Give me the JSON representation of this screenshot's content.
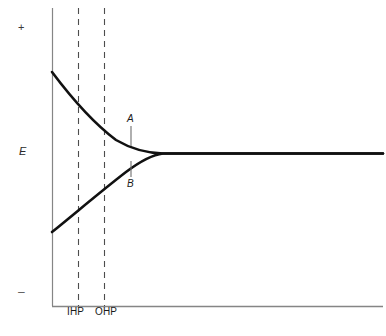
{
  "figure": {
    "type": "scientific-diagram",
    "background_color": "#ffffff",
    "width": 386,
    "height": 336
  },
  "axes": {
    "y_axis": {
      "label": "E",
      "top_sign": "+",
      "bottom_sign": "–",
      "x_px": 52,
      "top_px": 8,
      "bottom_px": 306,
      "color": "#808080"
    },
    "x_axis": {
      "label": "",
      "y_px": 306,
      "left_px": 52,
      "right_px": 383,
      "color": "#808080"
    }
  },
  "markers": [
    {
      "name": "IHP",
      "label": "IHP",
      "x_px": 78,
      "style": "dashed",
      "color": "#4d4d4d"
    },
    {
      "name": "OHP",
      "label": "OHP",
      "x_px": 104,
      "style": "dashed",
      "color": "#4d4d4d"
    }
  ],
  "curve_labels": [
    {
      "id": "A",
      "label": "A",
      "leader_x_px": 131,
      "leader_y1_px": 126,
      "leader_y2_px": 146
    },
    {
      "id": "B",
      "label": "B",
      "leader_x_px": 131,
      "leader_y1_px": 161,
      "leader_y2_px": 177
    }
  ],
  "chart_data": {
    "type": "line",
    "title": "",
    "xlabel": "",
    "ylabel": "E",
    "xlim": [
      0,
      386
    ],
    "ylim": [
      306,
      8
    ],
    "grid": false,
    "legend": "none",
    "annotations": [
      {
        "text": "+",
        "position": "y-axis-top"
      },
      {
        "text": "–",
        "position": "y-axis-bottom"
      },
      {
        "text": "E",
        "position": "y-axis-middle"
      },
      {
        "text": "IHP",
        "position": "x-axis-tick-1"
      },
      {
        "text": "OHP",
        "position": "x-axis-tick-2"
      },
      {
        "text": "A",
        "position": "upper-curve"
      },
      {
        "text": "B",
        "position": "lower-curve"
      }
    ],
    "series": [
      {
        "name": "A",
        "description": "upper curve: potential decays from positive value to bulk asymptote",
        "color": "#111111",
        "path": "M 52 72 C 70 96, 92 122, 116 140 C 133 150, 148 153, 163 153.5 L 383 153.5"
      },
      {
        "name": "B",
        "description": "lower curve: potential rises from negative value to same bulk asymptote",
        "color": "#111111",
        "path": "M 52 232 C 72 216, 100 192, 126 172 C 142 160, 154 154.5, 163 153.5 L 383 153.5"
      }
    ],
    "asymptote_y_px": 153.5
  }
}
